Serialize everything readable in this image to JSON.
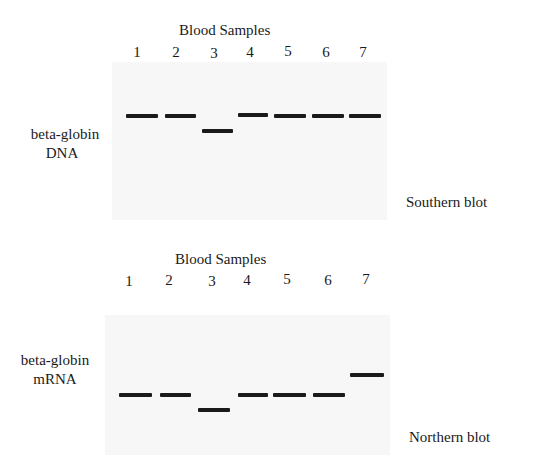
{
  "southern": {
    "title": "Blood Samples",
    "lanes": [
      "1",
      "2",
      "3",
      "4",
      "5",
      "6",
      "7"
    ],
    "probe_label_line1": "beta-globin",
    "probe_label_line2": "DNA",
    "blot_label": "Southern blot",
    "bands": [
      {
        "lane": "1",
        "x": 126,
        "y": 114,
        "w": 32
      },
      {
        "lane": "2",
        "x": 165,
        "y": 114,
        "w": 31
      },
      {
        "lane": "3",
        "x": 202,
        "y": 129,
        "w": 31
      },
      {
        "lane": "4",
        "x": 238,
        "y": 113,
        "w": 30
      },
      {
        "lane": "5",
        "x": 274,
        "y": 114,
        "w": 32
      },
      {
        "lane": "6",
        "x": 312,
        "y": 114,
        "w": 32
      },
      {
        "lane": "7",
        "x": 349,
        "y": 114,
        "w": 32
      }
    ]
  },
  "northern": {
    "title": "Blood Samples",
    "lanes": [
      "1",
      "2",
      "3",
      "4",
      "5",
      "6",
      "7"
    ],
    "probe_label_line1": "beta-globin",
    "probe_label_line2": "mRNA",
    "blot_label": "Northern blot",
    "bands": [
      {
        "lane": "1",
        "x": 119,
        "y": 393,
        "w": 33
      },
      {
        "lane": "2",
        "x": 160,
        "y": 393,
        "w": 31
      },
      {
        "lane": "3",
        "x": 198,
        "y": 408,
        "w": 32
      },
      {
        "lane": "4",
        "x": 238,
        "y": 393,
        "w": 30
      },
      {
        "lane": "5",
        "x": 273,
        "y": 393,
        "w": 33
      },
      {
        "lane": "6",
        "x": 313,
        "y": 393,
        "w": 32
      },
      {
        "lane": "7",
        "x": 350,
        "y": 373,
        "w": 34
      }
    ]
  }
}
